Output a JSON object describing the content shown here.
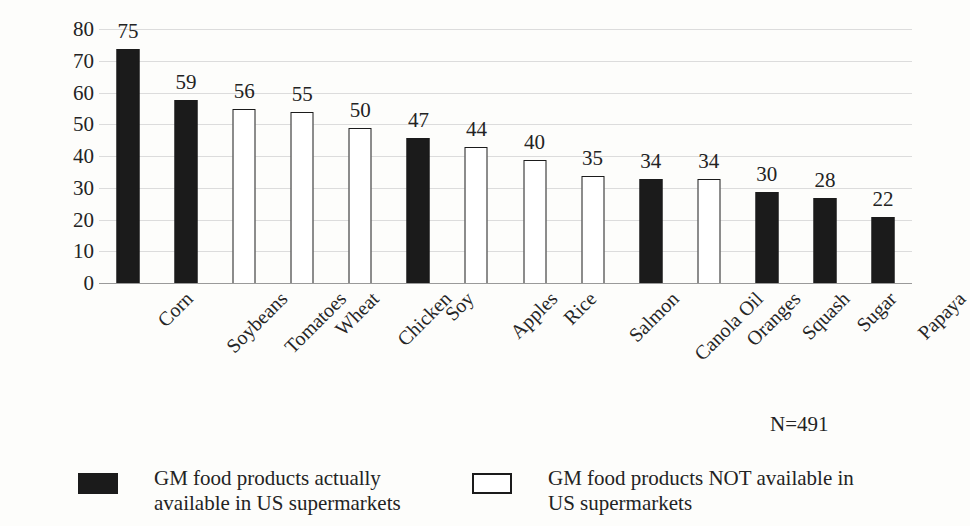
{
  "chart_data": {
    "type": "bar",
    "title": "",
    "subtitle": "",
    "xlabel": "",
    "ylabel": "Percent \"Yes\"",
    "ylim": [
      0,
      80
    ],
    "y_ticks": [
      0,
      10,
      20,
      30,
      40,
      50,
      60,
      70,
      80
    ],
    "grid": true,
    "legend_position": "bottom",
    "annotation": "N=491",
    "categories": [
      "Corn",
      "Soybeans",
      "Tomatoes",
      "Wheat",
      "Chicken",
      "Soy",
      "Apples",
      "Rice",
      "Salmon",
      "Canola Oil",
      "Oranges",
      "Squash",
      "Sugar",
      "Papaya"
    ],
    "values": [
      75,
      59,
      56,
      55,
      50,
      47,
      44,
      40,
      35,
      34,
      34,
      30,
      28,
      22
    ],
    "bar_styles": [
      "filled",
      "filled",
      "hollow",
      "hollow",
      "hollow",
      "filled",
      "hollow",
      "hollow",
      "hollow",
      "filled",
      "hollow",
      "filled",
      "filled",
      "filled"
    ],
    "series": [
      {
        "name": "GM food products actually available in US supermarkets",
        "style": "filled",
        "points": [
          {
            "category": "Corn",
            "value": 75
          },
          {
            "category": "Soybeans",
            "value": 59
          },
          {
            "category": "Soy",
            "value": 47
          },
          {
            "category": "Canola Oil",
            "value": 34
          },
          {
            "category": "Squash",
            "value": 30
          },
          {
            "category": "Sugar",
            "value": 28
          },
          {
            "category": "Papaya",
            "value": 22
          }
        ]
      },
      {
        "name": "GM food products NOT available in US supermarkets",
        "style": "hollow",
        "points": [
          {
            "category": "Tomatoes",
            "value": 56
          },
          {
            "category": "Wheat",
            "value": 55
          },
          {
            "category": "Chicken",
            "value": 50
          },
          {
            "category": "Apples",
            "value": 44
          },
          {
            "category": "Rice",
            "value": 40
          },
          {
            "category": "Salmon",
            "value": 35
          },
          {
            "category": "Oranges",
            "value": 34
          }
        ]
      }
    ],
    "data_labels": [
      "75",
      "59",
      "56",
      "55",
      "50",
      "47",
      "44",
      "40",
      "35",
      "34",
      "34",
      "30",
      "28",
      "22"
    ],
    "legend": [
      {
        "style": "filled",
        "line1": "GM food products actually",
        "line2": "available in US supermarkets"
      },
      {
        "style": "hollow",
        "line1": "GM food products NOT available in",
        "line2": "US supermarkets"
      }
    ],
    "colors": {
      "filled_bar": "#1b1b1b",
      "hollow_bar_fill": "#ffffff",
      "hollow_bar_border": "#1b1b1b",
      "gridline": "#dcdcdc",
      "axis": "#9a9a9a",
      "text": "#232323",
      "background": "#fdfdfb"
    }
  }
}
